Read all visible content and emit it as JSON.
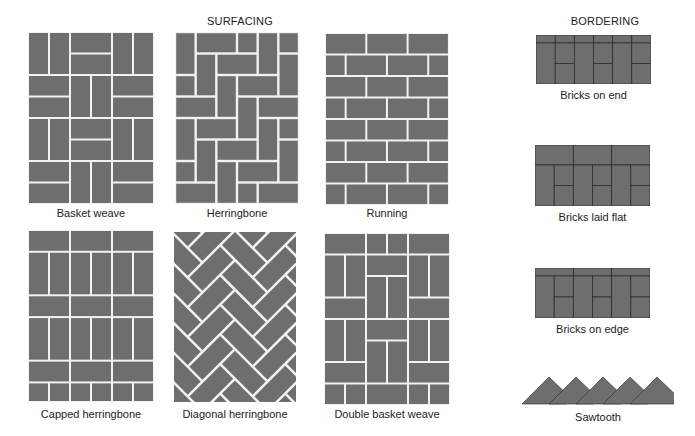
{
  "headings": {
    "surfacing": "SURFACING",
    "bordering": "BORDERING"
  },
  "colors": {
    "brick": "#6e6e6e",
    "joint_light": "#f2f2f2",
    "joint_dark": "#2a2a2a",
    "background": "#ffffff"
  },
  "surfacing_patterns": [
    {
      "id": "basket-weave",
      "label": "Basket weave"
    },
    {
      "id": "herringbone",
      "label": "Herringbone"
    },
    {
      "id": "running",
      "label": "Running"
    },
    {
      "id": "capped-herringbone",
      "label": "Capped herringbone"
    },
    {
      "id": "diagonal-herringbone",
      "label": "Diagonal herringbone"
    },
    {
      "id": "double-basket-weave",
      "label": "Double basket weave"
    }
  ],
  "bordering_patterns": [
    {
      "id": "bricks-on-end",
      "label": "Bricks on end"
    },
    {
      "id": "bricks-laid-flat",
      "label": "Bricks laid flat"
    },
    {
      "id": "bricks-on-edge",
      "label": "Bricks on edge"
    },
    {
      "id": "sawtooth",
      "label": "Sawtooth"
    }
  ]
}
